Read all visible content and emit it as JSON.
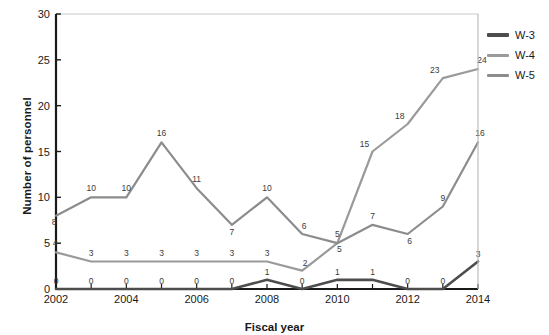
{
  "chart_data": {
    "type": "line",
    "title": "",
    "xlabel": "Fiscal year",
    "ylabel": "Number of personnel",
    "x": [
      2002,
      2003,
      2004,
      2005,
      2006,
      2007,
      2008,
      2009,
      2010,
      2011,
      2012,
      2013,
      2014
    ],
    "xtick_labels": [
      "2002",
      "2004",
      "2006",
      "2008",
      "2010",
      "2012",
      "2014"
    ],
    "xtick_values": [
      2002,
      2004,
      2006,
      2008,
      2010,
      2012,
      2014
    ],
    "ytick_labels": [
      "0",
      "5",
      "10",
      "15",
      "20",
      "25",
      "30"
    ],
    "ytick_values": [
      0,
      5,
      10,
      15,
      20,
      25,
      30
    ],
    "xlim": [
      2002,
      2014
    ],
    "ylim": [
      0,
      30
    ],
    "grid": false,
    "legend_position": "right",
    "data_labels": true,
    "series": [
      {
        "name": "W-3",
        "color": "#4d4d4d",
        "values": [
          0,
          0,
          0,
          0,
          0,
          0,
          1,
          0,
          1,
          1,
          0,
          0,
          3
        ]
      },
      {
        "name": "W-4",
        "color": "#9a9a9a",
        "values": [
          4,
          3,
          3,
          3,
          3,
          3,
          3,
          2,
          5,
          15,
          18,
          23,
          24
        ]
      },
      {
        "name": "W-5",
        "color": "#8c8c8c",
        "values": [
          8,
          10,
          10,
          16,
          11,
          7,
          10,
          6,
          5,
          7,
          6,
          9,
          16
        ]
      }
    ]
  },
  "legend": {
    "items": [
      {
        "label": "W-3",
        "color": "#4d4d4d"
      },
      {
        "label": "W-4",
        "color": "#9a9a9a"
      },
      {
        "label": "W-5",
        "color": "#8c8c8c"
      }
    ]
  },
  "axes": {
    "y_title": "Number of personnel",
    "x_title": "Fiscal year"
  }
}
